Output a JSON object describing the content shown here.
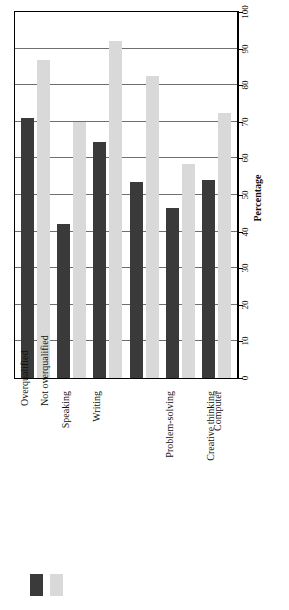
{
  "chart_data": {
    "type": "bar",
    "title": "",
    "xlabel": "",
    "ylabel": "Percentage",
    "ylim": [
      0,
      100
    ],
    "yticks": [
      0,
      10,
      20,
      30,
      40,
      50,
      60,
      70,
      80,
      90,
      100
    ],
    "grid": true,
    "orientation": "rotated-90",
    "legend_position": "bottom-left",
    "categories": [
      "Speaking",
      "Writing",
      "Problem-solving",
      "Creative thinking",
      "Computer",
      "Information management"
    ],
    "series": [
      {
        "name": "Overqualified",
        "color": "#3a3a3a",
        "values": [
          71,
          42,
          64.5,
          53.5,
          46.5,
          54
        ]
      },
      {
        "name": "Not overqualified",
        "color": "#d9d9d9",
        "values": [
          87,
          70,
          92,
          82.5,
          58.5,
          72.5
        ]
      }
    ]
  },
  "axis": {
    "title": "Percentage",
    "tick_labels": [
      "0",
      "10",
      "20",
      "30",
      "40",
      "50",
      "60",
      "70",
      "80",
      "90",
      "100"
    ]
  },
  "legend": {
    "items": [
      {
        "label": "Overqualified",
        "color": "#3a3a3a"
      },
      {
        "label": "Not overqualified",
        "color": "#d9d9d9"
      }
    ]
  },
  "colors": {
    "overqualified": "#3a3a3a",
    "not_overqualified": "#d9d9d9",
    "gridline": "#6f6f6f",
    "axis": "#000000",
    "background": "#ffffff"
  }
}
